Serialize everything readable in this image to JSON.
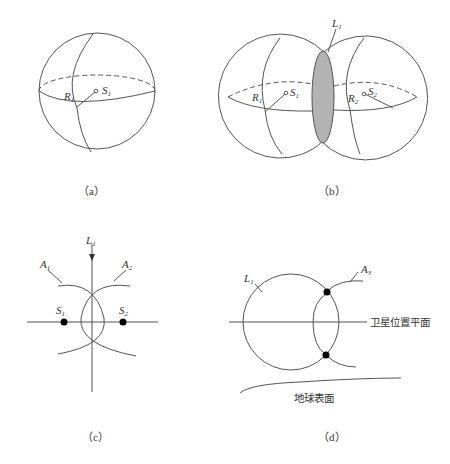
{
  "figure": {
    "panels": [
      {
        "id": "a",
        "caption": "（a）",
        "labels": {
          "radius": "R",
          "radius_sub": "1",
          "satellite": "S",
          "satellite_sub": "1"
        }
      },
      {
        "id": "b",
        "caption": "（b）",
        "labels": {
          "intersection": "L",
          "intersection_sub": "1",
          "radius1": "R",
          "radius1_sub": "1",
          "satellite1": "S",
          "satellite1_sub": "1",
          "radius2": "R",
          "radius2_sub": "2",
          "satellite2": "S",
          "satellite2_sub": "2"
        }
      },
      {
        "id": "c",
        "caption": "（c）",
        "labels": {
          "axis": "L",
          "axis_sub": "1",
          "arc1": "A",
          "arc1_sub": "1",
          "arc2": "A",
          "arc2_sub": "2",
          "satellite1": "S",
          "satellite1_sub": "1",
          "satellite2": "S",
          "satellite2_sub": "2"
        }
      },
      {
        "id": "d",
        "caption": "（d）",
        "labels": {
          "circle": "L",
          "circle_sub": "1",
          "arc3": "A",
          "arc3_sub": "3",
          "plane": "卫星位置平面",
          "earth": "地球表面"
        }
      }
    ],
    "colors": {
      "line": "#555555",
      "fill_intersection": "#b3b3b3",
      "point": "#000000"
    }
  }
}
